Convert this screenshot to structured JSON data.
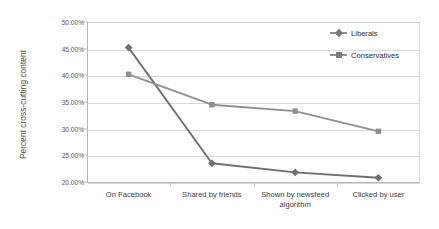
{
  "chart_data": {
    "type": "line",
    "title": "",
    "xlabel": "",
    "ylabel": "Percent cross-cutting content",
    "categories": [
      "On Facebook",
      "Shared by friends",
      "Shown by newsfeed algorithm",
      "Clicked by user"
    ],
    "ylim": [
      20,
      50
    ],
    "ytick_values": [
      20,
      25,
      30,
      35,
      40,
      45,
      50
    ],
    "ytick_labels": [
      "20.00%",
      "25.00%",
      "30.00%",
      "35.00%",
      "40.00%",
      "45.00%",
      "50.00%"
    ],
    "grid": true,
    "legend_position": "top-right",
    "series": [
      {
        "name": "Liberals",
        "marker": "diamond",
        "color": "#6f6f6f",
        "values": [
          45.2,
          23.5,
          21.8,
          20.8
        ]
      },
      {
        "name": "Conservatives",
        "marker": "square",
        "color": "#909090",
        "values": [
          40.2,
          34.5,
          33.3,
          29.5
        ]
      }
    ]
  },
  "legend": {
    "items": [
      {
        "label": "Liberals"
      },
      {
        "label": "Conservatives"
      }
    ]
  },
  "axes": {
    "y_title": "Percent cross-cutting content"
  }
}
